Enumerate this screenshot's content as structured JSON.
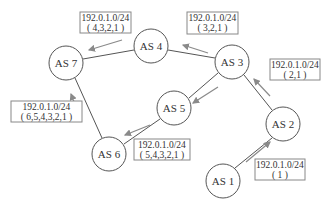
{
  "diagram": {
    "nodes": [
      {
        "id": "as7",
        "label": "AS 7",
        "cx": 66,
        "cy": 63
      },
      {
        "id": "as4",
        "label": "AS 4",
        "cx": 151,
        "cy": 46
      },
      {
        "id": "as3",
        "label": "AS 3",
        "cx": 232,
        "cy": 62
      },
      {
        "id": "as5",
        "label": "AS 5",
        "cx": 174,
        "cy": 108
      },
      {
        "id": "as6",
        "label": "AS 6",
        "cx": 109,
        "cy": 154
      },
      {
        "id": "as2",
        "label": "AS 2",
        "cx": 283,
        "cy": 124
      },
      {
        "id": "as1",
        "label": "AS 1",
        "cx": 223,
        "cy": 181
      }
    ],
    "edges": [
      [
        "as7",
        "as4"
      ],
      [
        "as4",
        "as3"
      ],
      [
        "as3",
        "as5"
      ],
      [
        "as5",
        "as6"
      ],
      [
        "as6",
        "as7"
      ],
      [
        "as3",
        "as2"
      ],
      [
        "as2",
        "as1"
      ]
    ],
    "annotations": [
      {
        "id": "ann-as4",
        "prefix": "192.0.1.0/24",
        "path": "( 4,3,2,1 )"
      },
      {
        "id": "ann-as3",
        "prefix": "192.0.1.0/24",
        "path": "( 3,2,1 )"
      },
      {
        "id": "ann-as2",
        "prefix": "192.0.1.0/24",
        "path": "( 2,1 )"
      },
      {
        "id": "ann-as6",
        "prefix": "192.0.1.0/24",
        "path": "( 6,5,4,3,2,1 )"
      },
      {
        "id": "ann-as5",
        "prefix": "192.0.1.0/24",
        "path": "( 5,4,3,2,1 )"
      },
      {
        "id": "ann-as1",
        "prefix": "192.0.1.0/24",
        "path": "( 1 )"
      }
    ],
    "colors": {
      "node_stroke": "#555555",
      "arrow": "#8a8a8a",
      "box_stroke": "#888888",
      "text": "#333333"
    }
  }
}
